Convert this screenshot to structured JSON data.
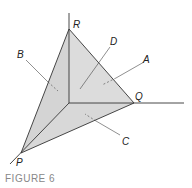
{
  "figure": {
    "caption": "FIGURE 6",
    "colors": {
      "face_fill": "#d9d9d9",
      "edge": "#333333",
      "leader": "#444444",
      "caption": "#888888"
    },
    "vertices": {
      "P": "P",
      "Q": "Q",
      "R": "R"
    },
    "face_labels": {
      "A": "A",
      "B": "B",
      "C": "C",
      "D": "D"
    }
  }
}
